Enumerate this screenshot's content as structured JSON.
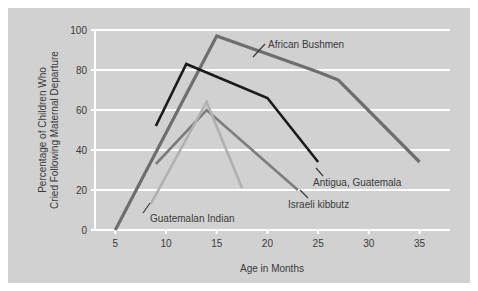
{
  "figure": {
    "background_color": "#ffffff",
    "panel_color": "#d1d1d1",
    "gridline_color": "#ffffff",
    "text_color": "#3a3a3a"
  },
  "axes": {
    "x_title": "Age in Months",
    "y_title_line1": "Percentage of Children Who",
    "y_title_line2": "Cried Following Maternal Departure",
    "x_ticks": [
      "5",
      "10",
      "15",
      "20",
      "25",
      "30",
      "35"
    ],
    "y_ticks": [
      "0",
      "20",
      "40",
      "60",
      "80",
      "100"
    ]
  },
  "labels": {
    "african_bushmen": "African Bushmen",
    "antigua_guatemala": "Antigua, Guatemala",
    "israeli_kibbutz": "Israeli kibbutz",
    "guatemalan_indian": "Guatemalan Indian"
  },
  "chart_data": {
    "type": "line",
    "title": "",
    "xlabel": "Age in Months",
    "ylabel": "Percentage of Children Who Cried Following Maternal Departure",
    "xlim": [
      3,
      38
    ],
    "ylim": [
      0,
      100
    ],
    "xticks": [
      5,
      10,
      15,
      20,
      25,
      30,
      35
    ],
    "yticks": [
      0,
      20,
      40,
      60,
      80,
      100
    ],
    "grid": "horizontal",
    "legend": "inline-annotations",
    "series": [
      {
        "name": "African Bushmen",
        "color": "#6e6e6e",
        "width": 3.2,
        "x": [
          5,
          15,
          25,
          27,
          35
        ],
        "y": [
          0,
          97,
          79,
          75,
          34
        ]
      },
      {
        "name": "Antigua, Guatemala",
        "color": "#1a1a1a",
        "width": 2.6,
        "x": [
          9,
          12,
          20,
          25
        ],
        "y": [
          52,
          83,
          66,
          34
        ]
      },
      {
        "name": "Israeli kibbutz",
        "color": "#7d7d7d",
        "width": 2.6,
        "x": [
          9,
          14,
          23
        ],
        "y": [
          33,
          60,
          20
        ]
      },
      {
        "name": "Guatemalan Indian",
        "color": "#b0b0b0",
        "width": 2.6,
        "x": [
          8.5,
          14,
          17.5
        ],
        "y": [
          13,
          64,
          21
        ]
      }
    ]
  }
}
